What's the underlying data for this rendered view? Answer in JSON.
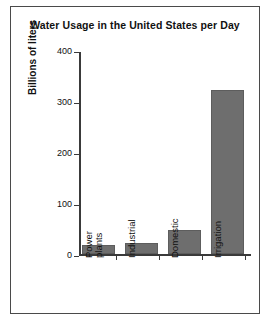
{
  "chart_data": {
    "type": "bar",
    "title": "Water Usage in the United States per Day",
    "xlabel": "",
    "ylabel": "Billions of liters",
    "categories": [
      "Power plants",
      "Industrial",
      "Domestic",
      "Irrigation"
    ],
    "category_lines": [
      [
        "Power",
        "plants"
      ],
      [
        "Industrial"
      ],
      [
        "Domestic"
      ],
      [
        "Irrigation"
      ]
    ],
    "values": [
      18,
      22,
      47,
      322
    ],
    "ylim": [
      0,
      400
    ],
    "yticks": [
      0,
      100,
      200,
      300,
      400
    ],
    "ytick_labels": [
      "0",
      "100",
      "200",
      "300",
      "400"
    ],
    "grid": false,
    "legend": false,
    "bar_color": "#6e6e6e",
    "axis_color": "#3a3a3a",
    "frame_color": "#4a4a4a",
    "background": "#ffffff"
  }
}
